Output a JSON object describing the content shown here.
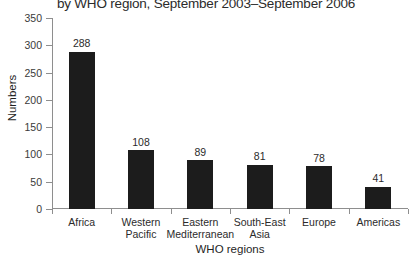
{
  "chart_data": {
    "type": "bar",
    "title": "by WHO region, September 2003–September 2006",
    "xlabel": "WHO regions",
    "ylabel": "Numbers",
    "categories": [
      "Africa",
      "Western Pacific",
      "Eastern Mediterranean",
      "South-East Asia",
      "Europe",
      "Americas"
    ],
    "category_lines": [
      [
        "Africa"
      ],
      [
        "Western",
        "Pacific"
      ],
      [
        "Eastern",
        "Mediterranean"
      ],
      [
        "South-East",
        "Asia"
      ],
      [
        "Europe"
      ],
      [
        "Americas"
      ]
    ],
    "values": [
      288,
      108,
      89,
      81,
      78,
      41
    ],
    "value_labels": [
      "288",
      "108",
      "89",
      "81",
      "78",
      "41"
    ],
    "ylim": [
      0,
      350
    ],
    "yticks": [
      0,
      50,
      100,
      150,
      200,
      250,
      300,
      350
    ],
    "ytick_labels": [
      "0",
      "50",
      "100",
      "150",
      "200",
      "250",
      "300",
      "350"
    ],
    "grid": false,
    "legend": null,
    "bar_color": "#1c1c1c",
    "axis_color": "#8e8e8e",
    "background": "#ffffff"
  }
}
